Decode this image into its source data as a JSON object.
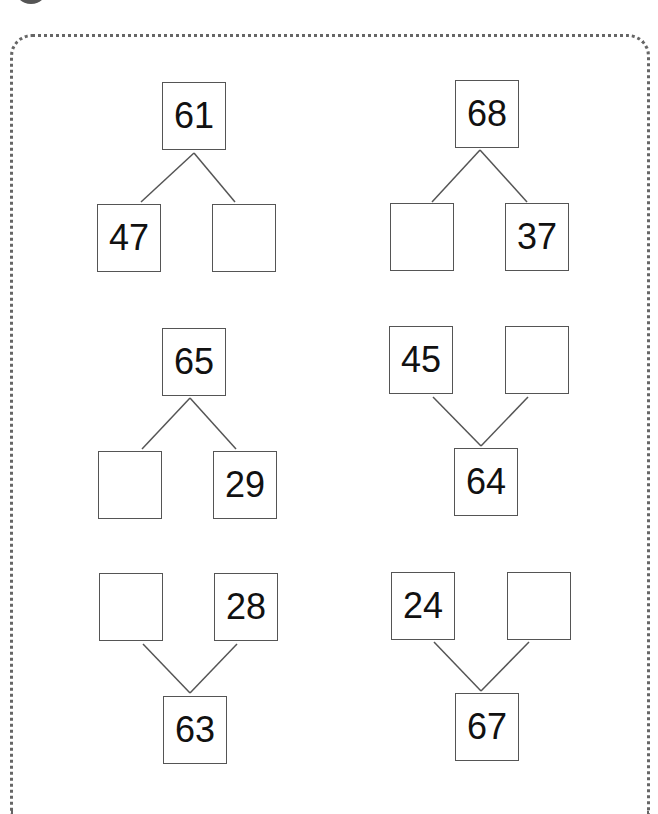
{
  "worksheet": {
    "problems": [
      {
        "orientation": "top-down",
        "whole": "61",
        "left": "47",
        "right": ""
      },
      {
        "orientation": "top-down",
        "whole": "68",
        "left": "",
        "right": "37"
      },
      {
        "orientation": "top-down",
        "whole": "65",
        "left": "",
        "right": "29"
      },
      {
        "orientation": "bottom-up",
        "whole": "64",
        "left": "45",
        "right": ""
      },
      {
        "orientation": "bottom-up",
        "whole": "63",
        "left": "",
        "right": "28"
      },
      {
        "orientation": "bottom-up",
        "whole": "67",
        "left": "24",
        "right": ""
      }
    ]
  }
}
